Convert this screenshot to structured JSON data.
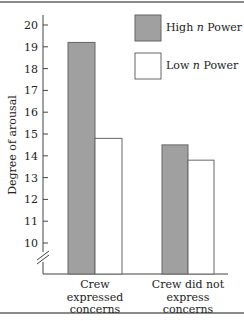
{
  "chart_data": {
    "type": "bar",
    "title": "",
    "xlabel": "",
    "ylabel": "Degree of arousal",
    "ylim": [
      10,
      20
    ],
    "y_ticks": [
      10,
      11,
      12,
      13,
      14,
      15,
      16,
      17,
      18,
      19,
      20
    ],
    "y_axis_break": true,
    "grid": false,
    "legend_position": "top-right",
    "categories": [
      [
        "Crew",
        "expressed",
        "concerns"
      ],
      [
        "Crew did not",
        "express",
        "concerns"
      ]
    ],
    "series": [
      {
        "name": "High n Power",
        "color": "#a0a0a0",
        "values": [
          19.2,
          14.5
        ]
      },
      {
        "name": "Low n Power",
        "color": "#ffffff",
        "values": [
          14.8,
          13.8
        ]
      }
    ]
  },
  "legend": {
    "items": [
      {
        "prefix": "High ",
        "italic": "n",
        "suffix": " Power"
      },
      {
        "prefix": "Low ",
        "italic": "n",
        "suffix": " Power"
      }
    ]
  }
}
